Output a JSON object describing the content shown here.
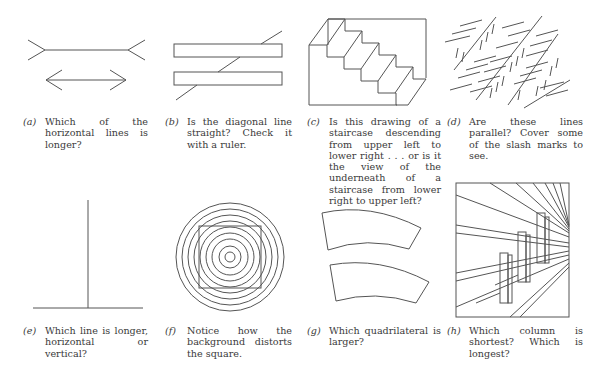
{
  "figures": [
    {
      "label": "(a)",
      "caption": "Which of the horizontal lines is longer?",
      "subject": "muller-lyer-illusion"
    },
    {
      "label": "(b)",
      "caption": "Is the diagonal line straight? Check it with a ruler.",
      "subject": "poggendorff-illusion"
    },
    {
      "label": "(c)",
      "caption": "Is this drawing of a staircase descending from upper left to lower right . . . or is it the view of the underneath of a staircase from lower right to upper left?",
      "subject": "schroeder-staircase"
    },
    {
      "label": "(d)",
      "caption": "Are these lines parallel? Cover some of the slash marks to see.",
      "subject": "zollner-illusion"
    },
    {
      "label": "(e)",
      "caption": "Which line is longer, horizontal or vertical?",
      "subject": "vertical-horizontal-illusion"
    },
    {
      "label": "(f)",
      "caption": "Notice how the background distorts the square.",
      "subject": "concentric-circles-square"
    },
    {
      "label": "(g)",
      "caption": "Which quadrilateral is larger?",
      "subject": "jastrow-illusion"
    },
    {
      "label": "(h)",
      "caption": "Which column is shortest? Which is longest?",
      "subject": "perspective-columns"
    }
  ]
}
